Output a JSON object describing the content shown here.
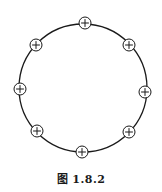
{
  "figure": {
    "caption": "图 1.8.2",
    "ring": {
      "cx": 83,
      "cy": 88,
      "r": 64,
      "stroke": "#1a1a1a"
    },
    "charge_symbol": "+",
    "charge_radius": 6,
    "charges": [
      {
        "name": "top",
        "cx": 85,
        "cy": 23
      },
      {
        "name": "upper-right",
        "cx": 129,
        "cy": 45
      },
      {
        "name": "right",
        "cx": 145,
        "cy": 92
      },
      {
        "name": "lower-right",
        "cx": 129,
        "cy": 132
      },
      {
        "name": "bottom",
        "cx": 82,
        "cy": 152
      },
      {
        "name": "lower-left",
        "cx": 37,
        "cy": 131
      },
      {
        "name": "left",
        "cx": 20,
        "cy": 89
      },
      {
        "name": "upper-left",
        "cx": 36,
        "cy": 45
      }
    ]
  }
}
